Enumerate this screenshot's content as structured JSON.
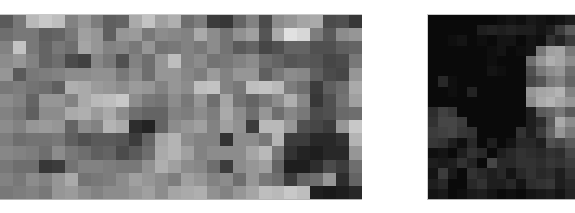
{
  "images": [
    {
      "name": "pixelated-image-left",
      "cols": 28,
      "rows": 14,
      "gray": [
        [
          90,
          120,
          185,
          200,
          190,
          130,
          150,
          125,
          95,
          100,
          170,
          195,
          160,
          175,
          110,
          125,
          60,
          55,
          100,
          130,
          75,
          140,
          150,
          165,
          170,
          75,
          80,
          55
        ],
        [
          110,
          120,
          120,
          95,
          100,
          120,
          160,
          150,
          95,
          150,
          155,
          120,
          140,
          135,
          130,
          170,
          140,
          115,
          145,
          160,
          85,
          170,
          225,
          215,
          125,
          90,
          140,
          150
        ],
        [
          130,
          195,
          120,
          100,
          120,
          110,
          165,
          150,
          130,
          135,
          120,
          150,
          115,
          120,
          130,
          120,
          140,
          115,
          90,
          100,
          70,
          80,
          100,
          100,
          80,
          80,
          95,
          100
        ],
        [
          140,
          150,
          130,
          100,
          110,
          75,
          65,
          135,
          120,
          80,
          130,
          110,
          150,
          190,
          130,
          140,
          115,
          120,
          130,
          140,
          110,
          100,
          85,
          90,
          85,
          70,
          75,
          120
        ],
        [
          150,
          90,
          120,
          125,
          130,
          140,
          140,
          145,
          145,
          120,
          140,
          110,
          150,
          150,
          135,
          125,
          155,
          130,
          150,
          150,
          95,
          120,
          140,
          135,
          95,
          75,
          70,
          150
        ],
        [
          120,
          125,
          115,
          110,
          95,
          175,
          170,
          155,
          150,
          140,
          155,
          150,
          130,
          150,
          140,
          190,
          195,
          130,
          120,
          190,
          195,
          185,
          125,
          110,
          60,
          95,
          110,
          170
        ],
        [
          140,
          130,
          100,
          150,
          150,
          130,
          170,
          185,
          190,
          200,
          140,
          120,
          115,
          140,
          120,
          150,
          110,
          165,
          115,
          100,
          120,
          140,
          175,
          135,
          55,
          80,
          115,
          160
        ],
        [
          130,
          120,
          95,
          140,
          140,
          170,
          175,
          155,
          170,
          140,
          110,
          100,
          100,
          130,
          125,
          140,
          125,
          170,
          140,
          110,
          150,
          110,
          135,
          120,
          75,
          80,
          105,
          110
        ],
        [
          140,
          130,
          150,
          155,
          150,
          100,
          140,
          130,
          180,
          170,
          45,
          35,
          100,
          140,
          150,
          160,
          130,
          160,
          145,
          60,
          185,
          185,
          150,
          80,
          70,
          60,
          150,
          200
        ],
        [
          125,
          110,
          115,
          115,
          120,
          95,
          80,
          90,
          90,
          85,
          60,
          100,
          165,
          180,
          140,
          130,
          130,
          50,
          140,
          140,
          120,
          180,
          60,
          60,
          40,
          40,
          50,
          180
        ],
        [
          135,
          130,
          125,
          110,
          140,
          120,
          110,
          95,
          100,
          75,
          90,
          110,
          170,
          180,
          160,
          130,
          140,
          140,
          140,
          165,
          185,
          120,
          50,
          35,
          30,
          40,
          40,
          150
        ],
        [
          120,
          110,
          110,
          55,
          60,
          115,
          130,
          130,
          125,
          120,
          120,
          145,
          175,
          160,
          140,
          135,
          110,
          60,
          140,
          150,
          160,
          100,
          30,
          30,
          45,
          75,
          60,
          110
        ],
        [
          130,
          120,
          140,
          130,
          150,
          170,
          115,
          120,
          125,
          140,
          160,
          150,
          140,
          125,
          160,
          150,
          130,
          140,
          110,
          150,
          120,
          110,
          60,
          100,
          110,
          150,
          45,
          100
        ],
        [
          120,
          125,
          130,
          120,
          150,
          155,
          140,
          130,
          140,
          140,
          150,
          160,
          140,
          165,
          170,
          175,
          145,
          130,
          150,
          165,
          190,
          185,
          200,
          190,
          30,
          25,
          30,
          40
        ]
      ]
    },
    {
      "name": "pixelated-image-right",
      "cols": 15,
      "rows": 18,
      "gray": [
        [
          10,
          10,
          10,
          10,
          10,
          10,
          10,
          15,
          20,
          15,
          25,
          20,
          15,
          20,
          30
        ],
        [
          10,
          10,
          10,
          10,
          10,
          30,
          35,
          30,
          35,
          30,
          30,
          20,
          30,
          60,
          90
        ],
        [
          10,
          10,
          15,
          20,
          10,
          15,
          10,
          20,
          20,
          10,
          20,
          15,
          50,
          35,
          60
        ],
        [
          10,
          10,
          10,
          10,
          10,
          10,
          15,
          20,
          10,
          15,
          20,
          120,
          160,
          165,
          120
        ],
        [
          10,
          10,
          10,
          10,
          10,
          10,
          15,
          10,
          10,
          10,
          110,
          150,
          175,
          165,
          140
        ],
        [
          10,
          10,
          10,
          10,
          10,
          10,
          20,
          15,
          10,
          10,
          80,
          120,
          140,
          150,
          110
        ],
        [
          10,
          40,
          15,
          10,
          10,
          10,
          10,
          10,
          10,
          10,
          70,
          85,
          120,
          130,
          100
        ],
        [
          10,
          10,
          15,
          10,
          35,
          10,
          10,
          10,
          10,
          10,
          150,
          165,
          170,
          180,
          130
        ],
        [
          10,
          10,
          10,
          10,
          10,
          10,
          10,
          10,
          10,
          10,
          140,
          170,
          180,
          165,
          150
        ],
        [
          45,
          65,
          55,
          10,
          10,
          10,
          10,
          10,
          10,
          10,
          30,
          90,
          100,
          120,
          90
        ],
        [
          50,
          70,
          70,
          60,
          10,
          10,
          10,
          10,
          10,
          10,
          30,
          45,
          90,
          170,
          140
        ],
        [
          60,
          65,
          70,
          55,
          50,
          10,
          10,
          10,
          10,
          50,
          30,
          60,
          100,
          150,
          120
        ],
        [
          55,
          50,
          30,
          15,
          40,
          10,
          30,
          10,
          20,
          40,
          40,
          30,
          80,
          70,
          90
        ],
        [
          15,
          20,
          10,
          30,
          50,
          40,
          10,
          30,
          40,
          50,
          45,
          40,
          50,
          45,
          70
        ],
        [
          30,
          25,
          30,
          50,
          35,
          10,
          70,
          40,
          40,
          50,
          50,
          45,
          55,
          50,
          60
        ],
        [
          20,
          60,
          25,
          10,
          50,
          40,
          30,
          40,
          20,
          40,
          50,
          40,
          45,
          30,
          50
        ],
        [
          30,
          40,
          10,
          10,
          40,
          50,
          30,
          30,
          40,
          20,
          45,
          50,
          55,
          30,
          40
        ],
        [
          20,
          25,
          10,
          15,
          25,
          30,
          20,
          10,
          15,
          10,
          20,
          25,
          30,
          20,
          35
        ]
      ]
    }
  ]
}
